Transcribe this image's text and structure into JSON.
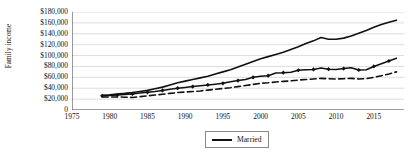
{
  "chart_data": {
    "type": "line",
    "title": "",
    "xlabel": "",
    "ylabel": "Family income",
    "xlim": [
      1975,
      2019
    ],
    "ylim": [
      0,
      180000
    ],
    "grid": true,
    "y_tick_labels": [
      "$180,000",
      "$160,000",
      "$140,000",
      "$120,000",
      "$100,000",
      "$80,000",
      "$60,000",
      "$40,000",
      "$20,000",
      "0"
    ],
    "y_tick_values": [
      180000,
      160000,
      140000,
      120000,
      100000,
      80000,
      60000,
      40000,
      20000,
      0
    ],
    "x_tick_labels": [
      "1975",
      "1980",
      "1985",
      "1990",
      "1995",
      "2000",
      "2005",
      "2010",
      "2015"
    ],
    "x_tick_values": [
      1975,
      1980,
      1985,
      1990,
      1995,
      2000,
      2005,
      2010,
      2015
    ],
    "legend_position": "bottom-center",
    "legend_entries": [
      "Married"
    ],
    "x": [
      1979,
      1980,
      1981,
      1982,
      1983,
      1984,
      1985,
      1986,
      1987,
      1988,
      1989,
      1990,
      1991,
      1992,
      1993,
      1994,
      1995,
      1996,
      1997,
      1998,
      1999,
      2000,
      2001,
      2002,
      2003,
      2004,
      2005,
      2006,
      2007,
      2008,
      2009,
      2010,
      2011,
      2012,
      2013,
      2014,
      2015,
      2016,
      2017,
      2018
    ],
    "series": [
      {
        "name": "Married",
        "style": "solid",
        "markers": false,
        "values": [
          27000,
          28000,
          29500,
          30500,
          32000,
          34000,
          36000,
          39000,
          42000,
          46000,
          50000,
          53000,
          56000,
          59000,
          62000,
          66000,
          70000,
          74000,
          79000,
          84000,
          89000,
          94000,
          98000,
          102000,
          106000,
          111000,
          116000,
          122000,
          127000,
          133000,
          130000,
          130000,
          132000,
          136000,
          141000,
          146000,
          152000,
          157000,
          161000,
          165000
        ]
      },
      {
        "name": "series-2",
        "style": "solid",
        "markers": true,
        "values": [
          26000,
          26500,
          27500,
          28500,
          29500,
          31000,
          32500,
          34000,
          36000,
          38000,
          40000,
          41500,
          43000,
          44500,
          46000,
          47500,
          49000,
          52000,
          54000,
          56000,
          60000,
          62000,
          63000,
          68000,
          68500,
          69500,
          73000,
          74000,
          74500,
          77000,
          75000,
          74500,
          76000,
          77500,
          73500,
          74000,
          80000,
          85000,
          90000,
          95000
        ]
      },
      {
        "name": "series-3",
        "style": "dashed",
        "markers": false,
        "values": [
          24000,
          24000,
          24000,
          23500,
          23000,
          24500,
          26000,
          27500,
          29000,
          30500,
          32000,
          33000,
          34000,
          35000,
          36500,
          38000,
          39500,
          41000,
          43000,
          45000,
          47000,
          49000,
          50000,
          51500,
          52500,
          53500,
          55000,
          56000,
          57000,
          58000,
          57500,
          57000,
          57500,
          58000,
          57000,
          57500,
          60000,
          63000,
          66000,
          70000
        ]
      }
    ]
  },
  "legend": {
    "items": [
      {
        "label": "Married",
        "style": "solid"
      }
    ]
  }
}
